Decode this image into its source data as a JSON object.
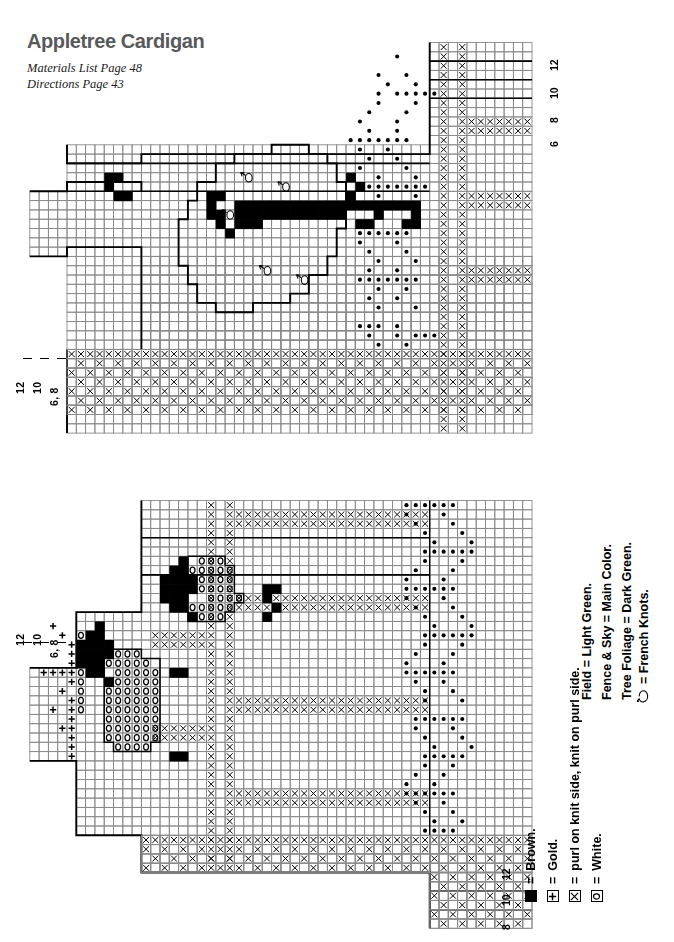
{
  "header": {
    "title": "Appletree Cardigan",
    "materials_line": "Materials List Page 48",
    "directions_line": "Directions Page 43"
  },
  "legend_right": {
    "lines": [
      "Field = Light Green.",
      "Fence & Sky = Main Color.",
      "Tree Foliage = Dark Green.",
      "= French Knots."
    ],
    "knot_symbol_name": "french-knot-glyph"
  },
  "legend_bottom": {
    "rows": [
      {
        "symbol": "filled-square",
        "eq": "=",
        "label": "Brown."
      },
      {
        "symbol": "plus-box",
        "eq": "=",
        "label": "Gold."
      },
      {
        "symbol": "x-box",
        "eq": "=",
        "label": "purl on knit side, knit on purl side."
      },
      {
        "symbol": "o-box",
        "eq": "=",
        "label": "White."
      }
    ]
  },
  "scales": {
    "top_right": [
      "12",
      "10",
      "8",
      "6"
    ],
    "bottom_right": [
      "12",
      "10",
      "8",
      "6"
    ],
    "chart_top_left": [
      "12",
      "10",
      "6, 8"
    ],
    "chart_bottom_left": [
      "12",
      "10",
      "6, 8"
    ]
  },
  "colors": {
    "ink": "#000000",
    "title_gray": "#58595b",
    "grid_light": "#8a8a8a",
    "grid_heavy": "#000000",
    "paper": "#ffffff"
  },
  "chart_data": [
    {
      "id": "appletree-chart-top",
      "type": "heatmap",
      "title": "Appletree Cardigan — upper chart (tree with apples)",
      "grid": {
        "cols": 56,
        "rows": 40,
        "cell_px": 9.3
      },
      "symbols": {
        "blank": "Main Color / plain knit",
        "x": "purl on knit side, knit on purl side",
        "dot": "French Knot (apple / foliage accent)",
        "fill": "Brown (trunk & branches)",
        "o": "White",
        "plus": "Gold",
        "apple": "French knot apple motif"
      },
      "outline_note": "Bold outlines mark garment shaping steps (armhole / shoulder / neckline).",
      "cells": {
        "fill": [
          [
            9,
            14
          ],
          [
            10,
            14
          ],
          [
            9,
            15
          ],
          [
            10,
            16
          ],
          [
            11,
            16
          ],
          [
            20,
            16
          ],
          [
            21,
            16
          ],
          [
            20,
            17
          ],
          [
            20,
            18
          ],
          [
            21,
            18
          ],
          [
            35,
            14
          ],
          [
            36,
            15
          ],
          [
            35,
            16
          ],
          [
            23,
            17
          ],
          [
            24,
            17
          ],
          [
            25,
            17
          ],
          [
            26,
            17
          ],
          [
            27,
            17
          ],
          [
            28,
            17
          ],
          [
            29,
            17
          ],
          [
            30,
            17
          ],
          [
            31,
            17
          ],
          [
            32,
            17
          ],
          [
            33,
            17
          ],
          [
            34,
            17
          ],
          [
            35,
            17
          ],
          [
            36,
            17
          ],
          [
            37,
            17
          ],
          [
            38,
            17
          ],
          [
            39,
            17
          ],
          [
            40,
            17
          ],
          [
            41,
            17
          ],
          [
            42,
            17
          ],
          [
            23,
            18
          ],
          [
            24,
            18
          ],
          [
            25,
            18
          ],
          [
            26,
            18
          ],
          [
            27,
            18
          ],
          [
            28,
            18
          ],
          [
            29,
            18
          ],
          [
            30,
            18
          ],
          [
            31,
            18
          ],
          [
            32,
            18
          ],
          [
            33,
            18
          ],
          [
            34,
            18
          ],
          [
            38,
            18
          ],
          [
            42,
            18
          ],
          [
            23,
            19
          ],
          [
            24,
            19
          ],
          [
            25,
            19
          ],
          [
            36,
            19
          ],
          [
            37,
            19
          ],
          [
            41,
            19
          ],
          [
            42,
            19
          ],
          [
            21,
            19
          ],
          [
            22,
            20
          ]
        ],
        "x_columns": [
          47,
          49
        ],
        "x_bands": [
          {
            "rows": [
              22,
              23
            ],
            "col_from": 50,
            "col_to": 56
          },
          {
            "rows": [
              30,
              31
            ],
            "col_from": 50,
            "col_to": 56
          },
          {
            "rows": [
              9,
              10
            ],
            "col_from": 50,
            "col_to": 56
          }
        ],
        "checker_field_rows": [
          33,
          34,
          35,
          36,
          37,
          38,
          39
        ]
      }
    },
    {
      "id": "appletree-chart-bottom",
      "type": "heatmap",
      "title": "Appletree Cardigan — lower chart (sheep in field)",
      "grid": {
        "cols": 56,
        "rows": 44,
        "cell_px": 9.3
      },
      "symbols": {
        "blank": "Main Color / plain knit",
        "x": "purl on knit side, knit on purl side",
        "dot": "French Knot",
        "fill": "Brown (sheep heads / legs)",
        "o": "White (sheep fleece)",
        "plus": "Gold"
      },
      "motifs": [
        {
          "name": "sheep-upper",
          "fleece_symbol": "o",
          "head_symbol": "fill"
        },
        {
          "name": "sheep-lower",
          "fleece_symbol": "o",
          "head_symbol": "fill"
        },
        {
          "name": "gold-sprig",
          "symbol": "plus"
        }
      ],
      "x_columns": [
        20,
        22
      ],
      "checker_field_rows": [
        2,
        3,
        10,
        11,
        22,
        23,
        32,
        33
      ]
    }
  ]
}
